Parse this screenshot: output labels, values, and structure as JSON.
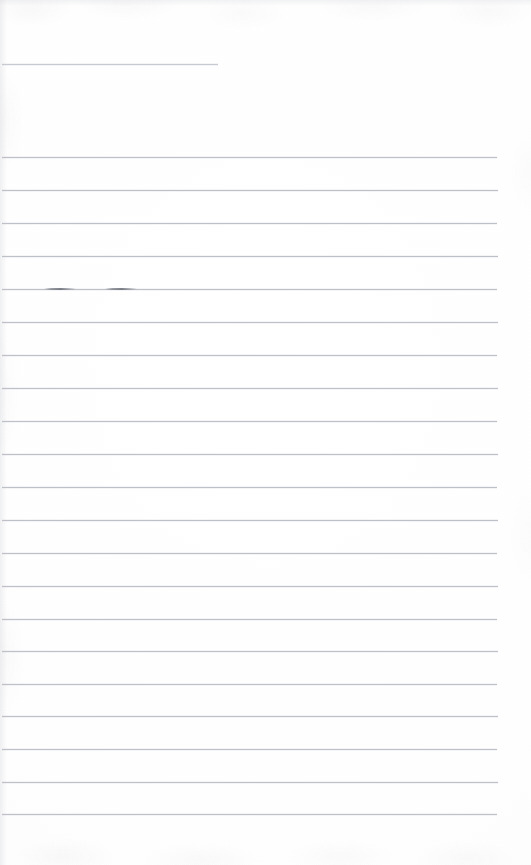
{
  "document": {
    "kind": "scanned-lined-paper",
    "title": "Blank ruled notebook page",
    "page_width": 531,
    "page_height": 865,
    "text_content": "",
    "has_handwriting": false,
    "colors": {
      "paper": "#fefefe",
      "rule": "#b9bcc4",
      "rule_light": "#c4c7ce",
      "ink_mark": "#70737c"
    },
    "margins": {
      "left": 2,
      "right": 35,
      "top": 64,
      "bottom": 51
    },
    "line_spacing_px": 32.8,
    "rule_count": 22
  },
  "rules": [
    {
      "id": "rule-01",
      "y": 64,
      "left": 2,
      "width": 216,
      "partial": true,
      "label": "short top rule"
    },
    {
      "id": "rule-02",
      "y": 157,
      "left": 2,
      "width": 495,
      "partial": false,
      "label": "ruled line 2"
    },
    {
      "id": "rule-03",
      "y": 190,
      "left": 2,
      "width": 496,
      "partial": false,
      "label": "ruled line 3"
    },
    {
      "id": "rule-04",
      "y": 223,
      "left": 2,
      "width": 495,
      "partial": false,
      "label": "ruled line 4"
    },
    {
      "id": "rule-05",
      "y": 256,
      "left": 2,
      "width": 496,
      "partial": false,
      "label": "ruled line 5"
    },
    {
      "id": "rule-06",
      "y": 289,
      "left": 2,
      "width": 495,
      "partial": false,
      "label": "ruled line 6 with ink marks"
    },
    {
      "id": "rule-07",
      "y": 322,
      "left": 2,
      "width": 496,
      "partial": false,
      "label": "ruled line 7"
    },
    {
      "id": "rule-08",
      "y": 355,
      "left": 2,
      "width": 495,
      "partial": false,
      "label": "ruled line 8"
    },
    {
      "id": "rule-09",
      "y": 388,
      "left": 2,
      "width": 496,
      "partial": false,
      "label": "ruled line 9"
    },
    {
      "id": "rule-10",
      "y": 421,
      "left": 2,
      "width": 495,
      "partial": false,
      "label": "ruled line 10"
    },
    {
      "id": "rule-11",
      "y": 454,
      "left": 2,
      "width": 496,
      "partial": false,
      "label": "ruled line 11"
    },
    {
      "id": "rule-12",
      "y": 487,
      "left": 2,
      "width": 495,
      "partial": false,
      "label": "ruled line 12"
    },
    {
      "id": "rule-13",
      "y": 520,
      "left": 2,
      "width": 496,
      "partial": false,
      "label": "ruled line 13"
    },
    {
      "id": "rule-14",
      "y": 553,
      "left": 2,
      "width": 495,
      "partial": false,
      "label": "ruled line 14"
    },
    {
      "id": "rule-15",
      "y": 586,
      "left": 2,
      "width": 496,
      "partial": false,
      "label": "ruled line 15"
    },
    {
      "id": "rule-16",
      "y": 619,
      "left": 2,
      "width": 495,
      "partial": false,
      "label": "ruled line 16"
    },
    {
      "id": "rule-17",
      "y": 651,
      "left": 2,
      "width": 496,
      "partial": false,
      "label": "ruled line 17"
    },
    {
      "id": "rule-18",
      "y": 684,
      "left": 2,
      "width": 495,
      "partial": false,
      "label": "ruled line 18"
    },
    {
      "id": "rule-19",
      "y": 716,
      "left": 2,
      "width": 496,
      "partial": false,
      "label": "ruled line 19"
    },
    {
      "id": "rule-20",
      "y": 749,
      "left": 2,
      "width": 495,
      "partial": false,
      "label": "ruled line 20"
    },
    {
      "id": "rule-21",
      "y": 782,
      "left": 2,
      "width": 496,
      "partial": false,
      "label": "ruled line 21"
    },
    {
      "id": "rule-22",
      "y": 814,
      "left": 2,
      "width": 495,
      "partial": false,
      "label": "ruled line 22"
    }
  ],
  "ink_marks": [
    {
      "id": "ink-mark-1",
      "x": 44,
      "y": 288,
      "width": 32,
      "label": "faint pen stroke on line 6"
    },
    {
      "id": "ink-mark-2",
      "x": 105,
      "y": 288,
      "width": 32,
      "label": "faint pen stroke on line 6"
    }
  ]
}
